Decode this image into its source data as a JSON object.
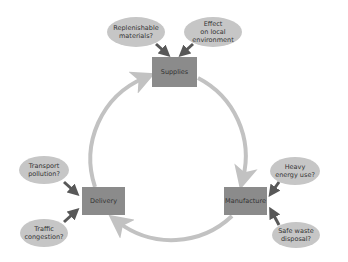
{
  "colors": {
    "box_fill": "#8b8b8b",
    "bubble_fill": "#c6c6c6",
    "cycle_arrow": "#c2c2c2",
    "pointer_arrow": "#585858",
    "text": "#333333"
  },
  "stages": [
    {
      "id": "supplies",
      "label": "Supplies"
    },
    {
      "id": "manufacture",
      "label": "Manufacture"
    },
    {
      "id": "delivery",
      "label": "Delivery"
    }
  ],
  "concerns": {
    "supplies": [
      {
        "label": "Replenishable\nmaterials?"
      },
      {
        "label": "Effect\non local\nenvironment"
      }
    ],
    "manufacture": [
      {
        "label": "Heavy\nenergy use?"
      },
      {
        "label": "Safe waste\ndisposal?"
      }
    ],
    "delivery": [
      {
        "label": "Transport\npollution?"
      },
      {
        "label": "Traffic\ncongestion?"
      }
    ]
  },
  "cycle_order": [
    "Supplies",
    "Manufacture",
    "Delivery",
    "Supplies"
  ]
}
